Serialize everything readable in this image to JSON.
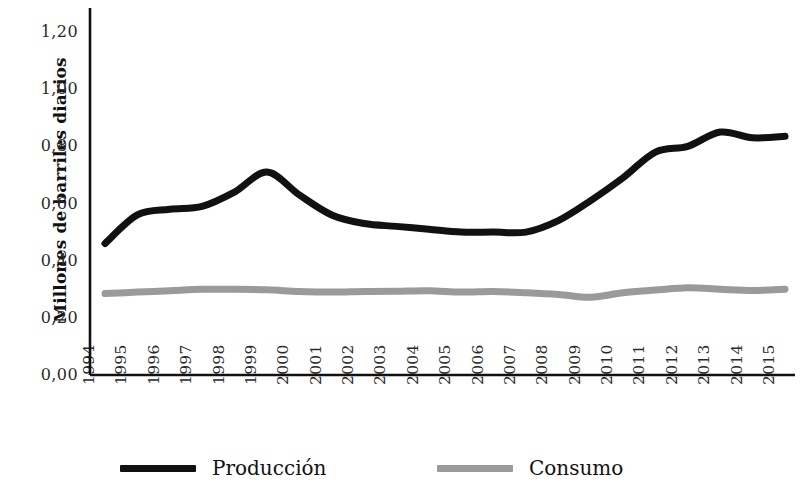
{
  "chart_data": {
    "type": "line",
    "title": "",
    "xlabel": "",
    "ylabel": "Millones de barriles diarios",
    "x": [
      1994,
      1995,
      1996,
      1997,
      1998,
      1999,
      2000,
      2001,
      2002,
      2003,
      2004,
      2005,
      2006,
      2007,
      2008,
      2009,
      2010,
      2011,
      2012,
      2013,
      2014,
      2015
    ],
    "categories": [
      "1994",
      "1995",
      "1996",
      "1997",
      "1998",
      "1999",
      "2000",
      "2001",
      "2002",
      "2003",
      "2004",
      "2005",
      "2006",
      "2007",
      "2008",
      "2009",
      "2010",
      "2011",
      "2012",
      "2013",
      "2014",
      "2015"
    ],
    "series": [
      {
        "name": "Producción",
        "color": "#111111",
        "values": [
          0.46,
          0.56,
          0.58,
          0.59,
          0.64,
          0.71,
          0.63,
          0.56,
          0.53,
          0.52,
          0.51,
          0.5,
          0.5,
          0.5,
          0.54,
          0.61,
          0.69,
          0.78,
          0.8,
          0.85,
          0.83,
          0.835
        ]
      },
      {
        "name": "Consumo",
        "color": "#9a9a9a",
        "values": [
          0.285,
          0.29,
          0.295,
          0.3,
          0.3,
          0.298,
          0.292,
          0.29,
          0.292,
          0.293,
          0.295,
          0.29,
          0.292,
          0.288,
          0.282,
          0.272,
          0.288,
          0.297,
          0.305,
          0.3,
          0.296,
          0.3
        ]
      }
    ],
    "ylim": [
      0.0,
      1.2
    ],
    "ytick_values": [
      0.0,
      0.2,
      0.4,
      0.6,
      0.8,
      1.0,
      1.2
    ],
    "ytick_labels": [
      "0,00",
      "0,20",
      "0,40",
      "0,60",
      "0,80",
      "1,00",
      "1,20"
    ],
    "grid": false,
    "legend_position": "bottom",
    "axis_color": "#111111",
    "background": "#ffffff"
  },
  "legend": {
    "entries": [
      {
        "label": "Producción",
        "color": "#111111"
      },
      {
        "label": "Consumo",
        "color": "#9a9a9a"
      }
    ]
  }
}
